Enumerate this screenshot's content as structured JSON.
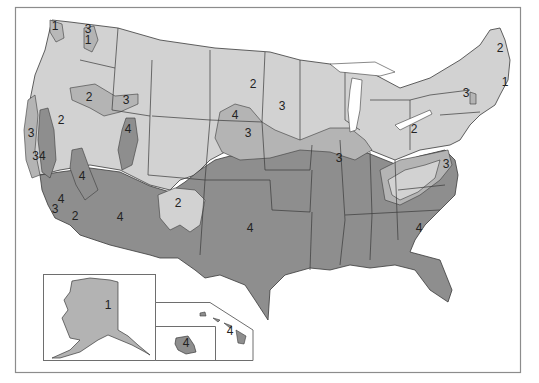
{
  "map": {
    "type": "zone-map",
    "subject": "United States with Alaska and Hawaii insets, divided into numbered zones",
    "colors": {
      "background": "#ffffff",
      "frame_border": "#8c8c8c",
      "state_border": "#3a3a3a",
      "zone_1": "#b8b8b8",
      "zone_2": "#d2d2d2",
      "zone_3": "#b4b4b4",
      "zone_4": "#8e8e8e",
      "inset_alaska_fill": "#b3b3b3",
      "inset_hawaii_fill": "#8e8e8e"
    },
    "zones": [
      "1",
      "2",
      "3",
      "4"
    ],
    "labels": [
      {
        "id": "wa-coast",
        "text": "1",
        "x": 55,
        "y": 30
      },
      {
        "id": "wa-cascade-3",
        "text": "3",
        "x": 88,
        "y": 33
      },
      {
        "id": "wa-cascade-1",
        "text": "1",
        "x": 88,
        "y": 44
      },
      {
        "id": "northern-plains",
        "text": "2",
        "x": 253,
        "y": 88
      },
      {
        "id": "maine",
        "text": "2",
        "x": 500,
        "y": 52
      },
      {
        "id": "new-england-coast",
        "text": "1",
        "x": 505,
        "y": 86
      },
      {
        "id": "oregon-idaho-2",
        "text": "2",
        "x": 89,
        "y": 101
      },
      {
        "id": "idaho-3",
        "text": "3",
        "x": 126,
        "y": 104
      },
      {
        "id": "sd-4",
        "text": "4",
        "x": 235,
        "y": 119
      },
      {
        "id": "minnesota-3",
        "text": "3",
        "x": 282,
        "y": 110
      },
      {
        "id": "new-york-3",
        "text": "3",
        "x": 466,
        "y": 97
      },
      {
        "id": "nevada-2",
        "text": "2",
        "x": 61,
        "y": 124
      },
      {
        "id": "utah-4",
        "text": "4",
        "x": 128,
        "y": 133
      },
      {
        "id": "nebraska-3",
        "text": "3",
        "x": 248,
        "y": 137
      },
      {
        "id": "ohio-2",
        "text": "2",
        "x": 414,
        "y": 133
      },
      {
        "id": "ca-coast-3",
        "text": "3",
        "x": 31,
        "y": 137
      },
      {
        "id": "ca-coast-34",
        "text": "34",
        "x": 39,
        "y": 160
      },
      {
        "id": "illinois-3",
        "text": "3",
        "x": 339,
        "y": 162
      },
      {
        "id": "virginia-3",
        "text": "3",
        "x": 446,
        "y": 168
      },
      {
        "id": "ca-inland-4",
        "text": "4",
        "x": 82,
        "y": 180
      },
      {
        "id": "socal-3",
        "text": "3",
        "x": 55,
        "y": 213
      },
      {
        "id": "socal-4",
        "text": "4",
        "x": 61,
        "y": 203
      },
      {
        "id": "socal-2",
        "text": "2",
        "x": 75,
        "y": 220
      },
      {
        "id": "new-mexico-2",
        "text": "2",
        "x": 178,
        "y": 207
      },
      {
        "id": "arizona-4",
        "text": "4",
        "x": 120,
        "y": 221
      },
      {
        "id": "oklahoma-4",
        "text": "4",
        "x": 250,
        "y": 232
      },
      {
        "id": "georgia-4",
        "text": "4",
        "x": 419,
        "y": 232
      },
      {
        "id": "alaska-1",
        "text": "1",
        "x": 108,
        "y": 309
      },
      {
        "id": "hawaii-4",
        "text": "4",
        "x": 186,
        "y": 347
      },
      {
        "id": "hawaii-islands-4",
        "text": "4",
        "x": 230,
        "y": 335
      }
    ],
    "insets": [
      {
        "name": "alaska",
        "zone": "1"
      },
      {
        "name": "hawaii",
        "zone": "4"
      }
    ]
  }
}
